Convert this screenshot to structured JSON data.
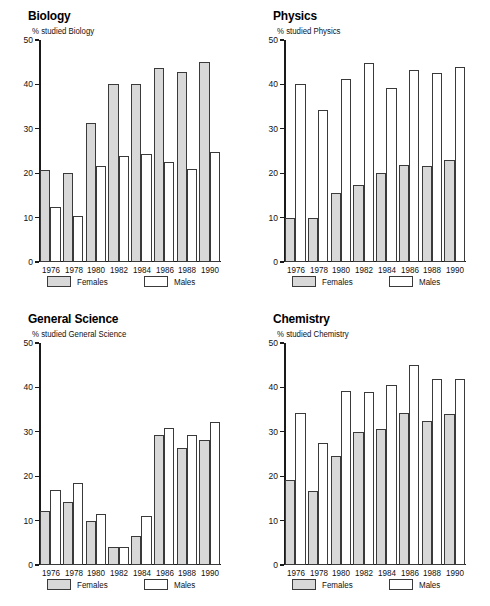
{
  "figure": {
    "series_names": [
      "Females",
      "Males"
    ],
    "series_colors": {
      "females": "#d8d8d8",
      "males": "#ffffff",
      "outline": "#3a3a3a"
    },
    "categories": [
      "1976",
      "1978",
      "1980",
      "1982",
      "1984",
      "1986",
      "1988",
      "1990"
    ],
    "y_ticks": [
      "0",
      "10",
      "20",
      "30",
      "40",
      "50"
    ]
  },
  "panels": {
    "biology": {
      "title": "Biology",
      "subtitle": "% studied Biology",
      "legend": {
        "females": "Females",
        "males": "Males"
      }
    },
    "physics": {
      "title": "Physics",
      "subtitle": "% studied Physics",
      "legend": {
        "females": "Females",
        "males": "Males"
      }
    },
    "general_science": {
      "title": "General Science",
      "subtitle": "% studied General Science",
      "legend": {
        "females": "Females",
        "males": "Males"
      }
    },
    "chemistry": {
      "title": "Chemistry",
      "subtitle": "% studied Chemistry",
      "legend": {
        "females": "Females",
        "males": "Males"
      }
    }
  },
  "chart_data": [
    {
      "id": "biology",
      "type": "bar",
      "title": "Biology",
      "subtitle": "% studied Biology",
      "xlabel": "",
      "ylabel": "% studied Biology",
      "ylim": [
        0,
        50
      ],
      "yticks": [
        0,
        10,
        20,
        30,
        40,
        50
      ],
      "grid": false,
      "legend_position": "below",
      "categories": [
        "1976",
        "1978",
        "1980",
        "1982",
        "1984",
        "1986",
        "1988",
        "1990"
      ],
      "series": [
        {
          "name": "Females",
          "values": [
            20.8,
            20.0,
            31.2,
            40.0,
            40.0,
            43.8,
            42.7,
            45.0
          ]
        },
        {
          "name": "Males",
          "values": [
            12.5,
            10.4,
            21.7,
            23.8,
            24.4,
            22.6,
            21.0,
            24.8
          ]
        }
      ]
    },
    {
      "id": "physics",
      "type": "bar",
      "title": "Physics",
      "subtitle": "% studied Physics",
      "xlabel": "",
      "ylabel": "% studied Physics",
      "ylim": [
        0,
        50
      ],
      "yticks": [
        0,
        10,
        20,
        30,
        40,
        50
      ],
      "grid": false,
      "legend_position": "below",
      "categories": [
        "1976",
        "1978",
        "1980",
        "1982",
        "1984",
        "1986",
        "1988",
        "1990"
      ],
      "series": [
        {
          "name": "Females",
          "values": [
            10.0,
            10.0,
            15.6,
            17.3,
            20.0,
            21.9,
            21.6,
            23.0
          ]
        },
        {
          "name": "Males",
          "values": [
            40.0,
            34.2,
            41.2,
            44.8,
            39.2,
            43.2,
            42.5,
            44.0
          ]
        }
      ]
    },
    {
      "id": "general_science",
      "type": "bar",
      "title": "General Science",
      "subtitle": "% studied General Science",
      "xlabel": "",
      "ylabel": "% studied General Science",
      "ylim": [
        0,
        50
      ],
      "yticks": [
        0,
        10,
        20,
        30,
        40,
        50
      ],
      "grid": false,
      "legend_position": "below",
      "categories": [
        "1976",
        "1978",
        "1980",
        "1982",
        "1984",
        "1986",
        "1988",
        "1990"
      ],
      "series": [
        {
          "name": "Females",
          "values": [
            12.2,
            14.2,
            10.0,
            4.0,
            6.6,
            29.2,
            26.4,
            28.2
          ]
        },
        {
          "name": "Males",
          "values": [
            16.8,
            18.4,
            11.6,
            4.0,
            11.0,
            30.9,
            29.2,
            32.2
          ]
        }
      ]
    },
    {
      "id": "chemistry",
      "type": "bar",
      "title": "Chemistry",
      "subtitle": "% studied Chemistry",
      "xlabel": "",
      "ylabel": "% studied Chemistry",
      "ylim": [
        0,
        50
      ],
      "yticks": [
        0,
        10,
        20,
        30,
        40,
        50
      ],
      "grid": false,
      "legend_position": "below",
      "categories": [
        "1976",
        "1978",
        "1980",
        "1982",
        "1984",
        "1986",
        "1988",
        "1990"
      ],
      "series": [
        {
          "name": "Females",
          "values": [
            19.1,
            16.7,
            24.6,
            30.0,
            30.7,
            34.2,
            32.4,
            34.1
          ]
        },
        {
          "name": "Males",
          "values": [
            34.2,
            27.5,
            39.3,
            39.0,
            40.6,
            45.0,
            41.8,
            41.9
          ]
        }
      ]
    }
  ]
}
